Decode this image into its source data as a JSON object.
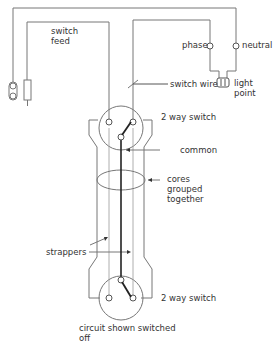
{
  "diagram": {
    "labels": {
      "switch_feed": "switch\nfeed",
      "phase": "phase",
      "neutral": "neutral",
      "switch_wire": "switch wire",
      "light_point": "light\npoint",
      "two_way_switch_top": "2 way switch",
      "common": "common",
      "cores_grouped": "cores\ngrouped\ntogether",
      "strappers": "strappers",
      "two_way_switch_bottom": "2 way switch",
      "circuit_state": "circuit shown switched\noff"
    },
    "colors": {
      "line": "#777777",
      "thick_line": "#222222",
      "text": "#333333"
    }
  }
}
